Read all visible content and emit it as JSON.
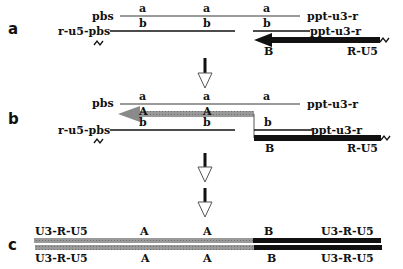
{
  "colors": {
    "black_strand": "#111111",
    "gray_strand": "#8a8a8a",
    "thin_gray": "#7a7a7a",
    "background": "#ffffff"
  },
  "panels": {
    "a": {
      "label": "a",
      "top_strand": {
        "left_label": "pbs",
        "right_label": "ppt-u3-r",
        "segment_labels": [
          "a",
          "a",
          "a"
        ]
      },
      "bottom_strand": {
        "left_label": "r-u5-pbs",
        "right_label": "ppt-u3-r",
        "segment_labels": [
          "b",
          "b",
          "b"
        ]
      },
      "minus_strand": {
        "start_label": "B",
        "end_label": "R-U5"
      }
    },
    "b": {
      "label": "b",
      "top_strand": {
        "left_label": "pbs",
        "right_label": "ppt-u3-r",
        "segment_labels": [
          "a",
          "a",
          "a"
        ]
      },
      "plus_strand_labels": [
        "A",
        "A"
      ],
      "bottom_strand": {
        "left_label": "r-u5-pbs",
        "right_label": "ppt-u3-r",
        "segment_labels": [
          "b",
          "b",
          "b"
        ]
      },
      "minus_strand": {
        "start_label": "B",
        "end_label": "R-U5"
      }
    },
    "c": {
      "label": "c",
      "top_labels": [
        "U3-R-U5",
        "A",
        "A",
        "B",
        "U3-R-U5"
      ],
      "bottom_labels": [
        "U3-R-U5",
        "A",
        "A",
        "B",
        "U3-R-U5"
      ]
    }
  },
  "icons": {
    "squiggle": "break-icon",
    "down_arrow": "hollow-down-arrow-icon"
  }
}
